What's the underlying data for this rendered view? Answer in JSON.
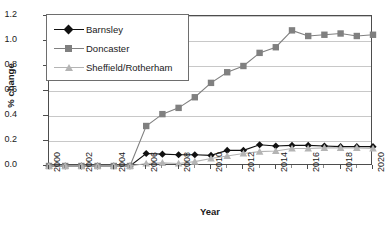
{
  "chart_data": {
    "type": "line",
    "title": "",
    "xlabel": "Year",
    "ylabel": "% change",
    "xlim": [
      2000,
      2020
    ],
    "ylim": [
      0.0,
      1.2
    ],
    "ytick_step": 0.2,
    "xtick_step": 2,
    "grid": "horizontal",
    "legend_position": "top-left-inside",
    "ytick_labels": [
      "0.0",
      "0.2",
      "0.4",
      "0.6",
      "0.8",
      "1.0",
      "1.2"
    ],
    "ytick_values": [
      0.0,
      0.2,
      0.4,
      0.6,
      0.8,
      1.0,
      1.2
    ],
    "xtick_labels": [
      "2000",
      "2002",
      "2004",
      "2006",
      "2008",
      "2010",
      "2012",
      "2014",
      "2016",
      "2018",
      "2020"
    ],
    "xtick_values": [
      2000,
      2002,
      2004,
      2006,
      2008,
      2010,
      2012,
      2014,
      2016,
      2018,
      2020
    ],
    "x": [
      2000,
      2001,
      2002,
      2003,
      2004,
      2005,
      2006,
      2007,
      2008,
      2009,
      2010,
      2011,
      2012,
      2013,
      2014,
      2015,
      2016,
      2017,
      2018,
      2019,
      2020
    ],
    "series": [
      {
        "name": "Barnsley",
        "color": "#111111",
        "marker": "diamond",
        "values": [
          0.0,
          0.0,
          0.0,
          0.0,
          0.0,
          0.0,
          0.1,
          0.095,
          0.09,
          0.09,
          0.085,
          0.125,
          0.125,
          0.17,
          0.16,
          0.165,
          0.165,
          0.16,
          0.155,
          0.155,
          0.155
        ]
      },
      {
        "name": "Doncaster",
        "color": "#808080",
        "marker": "square",
        "values": [
          0.0,
          0.0,
          0.0,
          0.0,
          0.0,
          0.0,
          0.32,
          0.415,
          0.465,
          0.55,
          0.665,
          0.75,
          0.8,
          0.905,
          0.95,
          1.085,
          1.04,
          1.05,
          1.06,
          1.04,
          1.05
        ]
      },
      {
        "name": "Sheffield/Rotherham",
        "color": "#b4b4b4",
        "marker": "triangle",
        "values": [
          0.0,
          0.0,
          0.0,
          0.0,
          0.0,
          0.0,
          0.02,
          0.025,
          0.02,
          0.035,
          0.06,
          0.08,
          0.1,
          0.115,
          0.12,
          0.14,
          0.14,
          0.145,
          0.145,
          0.145,
          0.14
        ]
      }
    ]
  }
}
